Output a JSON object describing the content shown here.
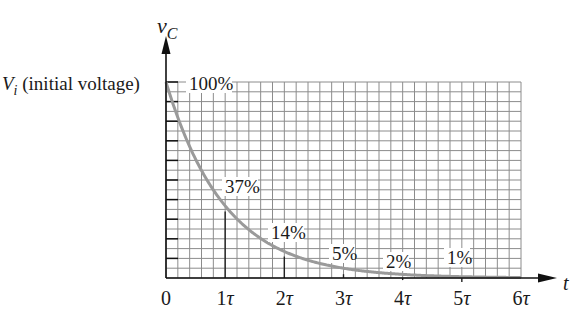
{
  "chart_data": {
    "type": "line",
    "title": "",
    "xlabel": "t",
    "ylabel": "v_C",
    "y_axis_label_main": "v",
    "y_axis_label_sub": "C",
    "initial_label_main": "V",
    "initial_label_sub": "i",
    "initial_label_text": " (initial voltage)",
    "x": [
      0,
      1,
      2,
      3,
      4,
      5,
      6
    ],
    "x_tick_labels": [
      "0",
      "1τ",
      "2τ",
      "3τ",
      "4τ",
      "5τ",
      "6τ"
    ],
    "series": [
      {
        "name": "capacitor voltage (exponential decay)",
        "values": [
          100,
          37,
          14,
          5,
          2,
          1,
          0.25
        ]
      }
    ],
    "annotations": [
      {
        "text": "100%",
        "x": 0,
        "y": 100
      },
      {
        "text": "37%",
        "x": 1,
        "y": 37
      },
      {
        "text": "14%",
        "x": 2,
        "y": 14
      },
      {
        "text": "5%",
        "x": 3,
        "y": 5
      },
      {
        "text": "2%",
        "x": 4,
        "y": 2
      },
      {
        "text": "1%",
        "x": 5,
        "y": 1
      }
    ],
    "xlim": [
      0,
      6
    ],
    "ylim": [
      0,
      100
    ],
    "grid": true,
    "legend": "none",
    "curve_color": "#9a9a9a",
    "grid_color": "#8c8c8c"
  }
}
